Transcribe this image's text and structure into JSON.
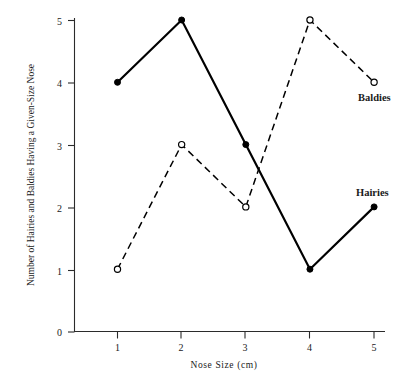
{
  "chart_data": {
    "type": "line",
    "title": "",
    "xlabel": "Nose Size (cm)",
    "ylabel": "Number of Hairies and Baldies Having a Given-Size Nose",
    "x": [
      1,
      2,
      3,
      4,
      5
    ],
    "xticklabels": [
      "1",
      "2",
      "3",
      "4",
      "5"
    ],
    "yticklabels": [
      "0",
      "1",
      "2",
      "3",
      "4",
      "5"
    ],
    "xlim": [
      0,
      5.35
    ],
    "ylim": [
      0,
      5
    ],
    "grid": false,
    "legend_position": "line-end-labels",
    "series": [
      {
        "name": "Hairies",
        "values": [
          4,
          5,
          3,
          1,
          2
        ],
        "linestyle": "solid",
        "marker": "filled-circle",
        "color": "#000000",
        "label_x": 5.0,
        "label_y": 2.55
      },
      {
        "name": "Baldies",
        "values": [
          1,
          3,
          2,
          5,
          4
        ],
        "linestyle": "dashed",
        "marker": "open-circle",
        "color": "#000000",
        "label_x": 5.0,
        "label_y": 3.55
      }
    ]
  },
  "axes": {
    "y_title": "Number of Hairies and Baldies Having a Given-Size Nose",
    "x_title": "Nose Size (cm)",
    "y_ticks": [
      {
        "label": "5"
      },
      {
        "label": "4"
      },
      {
        "label": "3"
      },
      {
        "label": "2"
      },
      {
        "label": "1"
      },
      {
        "label": "0"
      }
    ],
    "x_ticks": [
      {
        "label": "1"
      },
      {
        "label": "2"
      },
      {
        "label": "3"
      },
      {
        "label": "4"
      },
      {
        "label": "5"
      }
    ]
  },
  "labels": {
    "baldies": "Baldies",
    "hairies": "Hairies"
  }
}
